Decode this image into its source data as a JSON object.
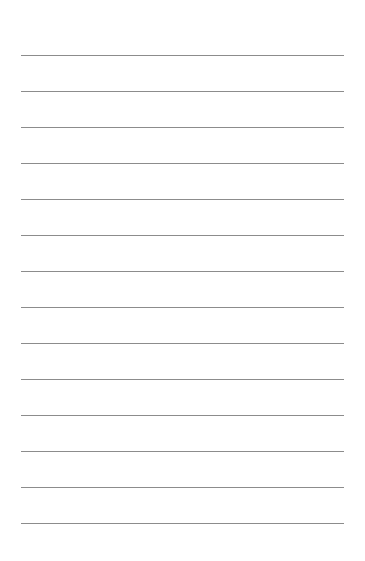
{
  "page": {
    "type": "lined-paper",
    "background_color": "#ffffff",
    "line_color": "#8c8c8c",
    "line_count": 14,
    "first_line_y": 55,
    "line_spacing": 36,
    "line_left": 21,
    "line_width": 323
  }
}
